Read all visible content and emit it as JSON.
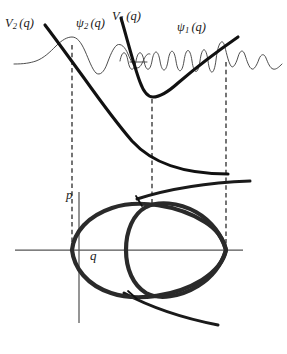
{
  "figure": {
    "background_color": "#ffffff",
    "width": 287,
    "height": 354
  },
  "labels": {
    "potential_2": {
      "symbol": "V",
      "subscript": "2",
      "argument": "(q)"
    },
    "potential_1": {
      "symbol": "V",
      "subscript": "1",
      "argument": "(q)"
    },
    "wave_2": {
      "symbol": "ψ",
      "subscript": "2",
      "argument": "(q)"
    },
    "wave_1": {
      "symbol": "ψ",
      "subscript": "1",
      "argument": "(q)"
    },
    "axis_p": "p",
    "axis_q": "q"
  },
  "colors": {
    "curve_heavy": "#111111",
    "curve_light": "#3a3a3a",
    "axis": "#555555",
    "dashed": "#111111",
    "text": "#1a1a1a"
  },
  "upper_panel": {
    "description": "Two potential energy curves V1 (bound well) and V2 (repulsive, descending) with their wavefunctions psi1 and psi2 drawn on top.",
    "potential_V2": {
      "type": "repulsive-descending",
      "start": [
        45,
        25
      ],
      "end": [
        228,
        174
      ],
      "stroke_width": 3.1
    },
    "potential_V1": {
      "type": "anharmonic-well",
      "left_wall_top": [
        121,
        18
      ],
      "minimum": [
        152,
        97
      ],
      "right_end": [
        238,
        37
      ],
      "stroke_width": 3.1
    },
    "wave_psi2": {
      "description": "Low-frequency oscillation peaking at left turning point q=72, decaying to the left and oscillating to the right",
      "turning_point_x": 72,
      "baseline_y": 58,
      "stroke_width": 0.9
    },
    "wave_psi1": {
      "description": "High-frequency oscillation inside the V1 well with amplitude maximum near right turning point q=226, decaying beyond",
      "turning_point_x": 226,
      "baseline_y": 60,
      "stroke_width": 0.9
    }
  },
  "dashed_lines": [
    {
      "name": "left-turning-point",
      "x": 72,
      "y_top": 45,
      "y_bottom": 252
    },
    {
      "name": "well-minimum",
      "x": 152,
      "y_top": 99,
      "y_bottom": 203
    },
    {
      "name": "right-turning-point",
      "x": 226,
      "y_top": 62,
      "y_bottom": 252
    }
  ],
  "lower_panel": {
    "description": "Phase-space (q,p) portrait with two nested closed orbits and open hyperbolic branches",
    "axes": {
      "p_axis": {
        "x": 79,
        "y_top": 192,
        "y_bottom": 323
      },
      "q_axis": {
        "y": 250,
        "x_left": 15,
        "x_right": 243
      }
    },
    "orbits": [
      {
        "name": "outer-orbit",
        "left_point": [
          72,
          250
        ],
        "right_point": [
          226,
          250
        ],
        "top_y": 203,
        "bottom_y": 300,
        "stroke_width": 4.2
      },
      {
        "name": "inner-orbit",
        "left_point": [
          113,
          250
        ],
        "right_point": [
          226,
          250
        ],
        "top_y": 204,
        "bottom_y": 298,
        "stroke_width": 4.2
      }
    ],
    "open_branches": [
      {
        "name": "upper-open-branch",
        "from": [
          140,
          196
        ],
        "to": [
          250,
          183
        ]
      },
      {
        "name": "lower-open-branch",
        "from": [
          122,
          292
        ],
        "to": [
          218,
          325
        ]
      }
    ],
    "crossing_marks": [
      {
        "name": "upper-crossing-tick",
        "at": [
          141,
          202
        ]
      },
      {
        "name": "lower-crossing-tick",
        "at": [
          133,
          296
        ]
      }
    ]
  }
}
